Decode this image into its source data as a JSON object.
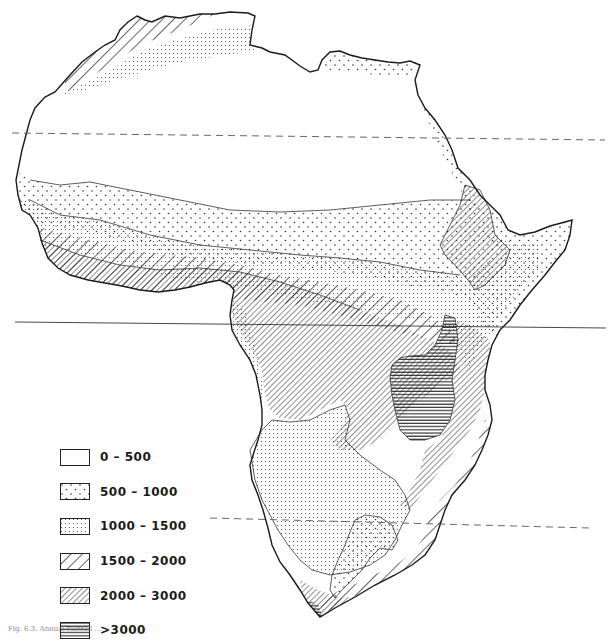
{
  "map": {
    "subject": "Africa",
    "line_color": "#222222",
    "background": "#ffffff",
    "reference_lines": [
      {
        "name": "tropic-of-cancer",
        "style": "dashed",
        "y_left": 133,
        "y_right": 140
      },
      {
        "name": "equator",
        "style": "solid",
        "y_left": 322,
        "y_right": 328
      },
      {
        "name": "tropic-of-capricorn",
        "style": "dashed",
        "y_left": 518,
        "y_right": 528
      }
    ]
  },
  "legend": {
    "items": [
      {
        "id": "z0",
        "label": "0 – 500",
        "pattern": "blank"
      },
      {
        "id": "z1",
        "label": "500 – 1000",
        "pattern": "sparse-dots"
      },
      {
        "id": "z2",
        "label": "1000 – 1500",
        "pattern": "dense-dots"
      },
      {
        "id": "z3",
        "label": "1500 – 2000",
        "pattern": "wide-diagonal-hatch"
      },
      {
        "id": "z4",
        "label": "2000 – 3000",
        "pattern": "narrow-diagonal-hatch"
      },
      {
        "id": "z5",
        "label": ">3000",
        "pattern": "horizontal-lines"
      }
    ]
  },
  "caption": {
    "text": "Fig. 6.3. Annual rainfall ..."
  }
}
